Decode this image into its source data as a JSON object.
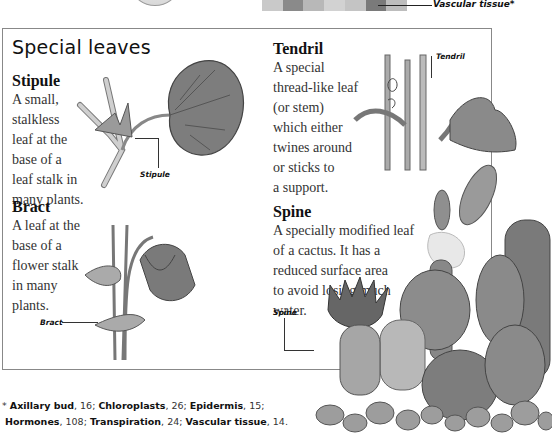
{
  "top": {
    "vascular_label": "Vascular tissue*"
  },
  "title": "Special leaves",
  "sections": {
    "stipule": {
      "heading": "Stipule",
      "text": "A small,\nstalkless\nleaf at the\nbase of a\nleaf stalk in\nmany plants.",
      "label": "Stipule"
    },
    "tendril": {
      "heading": "Tendril",
      "text": "A special\nthread-like leaf\n(or stem)\nwhich either\ntwines around\nor sticks to\na support.",
      "label": "Tendril"
    },
    "bract": {
      "heading": "Bract",
      "text": "A leaf at the\nbase of a\nflower stalk\nin many\nplants.",
      "label": "Bract"
    },
    "spine": {
      "heading": "Spine",
      "text": "A specially modified leaf\nof a cactus. It has a\nreduced surface area\nto avoid losing much\nwater.",
      "label": "Spine"
    }
  },
  "footnote": {
    "marker": "*",
    "entries": [
      {
        "term": "Axillary bud",
        "page": "16"
      },
      {
        "term": "Chloroplasts",
        "page": "26"
      },
      {
        "term": "Epidermis",
        "page": "15"
      },
      {
        "term": "Hormones",
        "page": "108"
      },
      {
        "term": "Transpiration",
        "page": "24"
      },
      {
        "term": "Vascular tissue",
        "page": "14"
      }
    ]
  }
}
